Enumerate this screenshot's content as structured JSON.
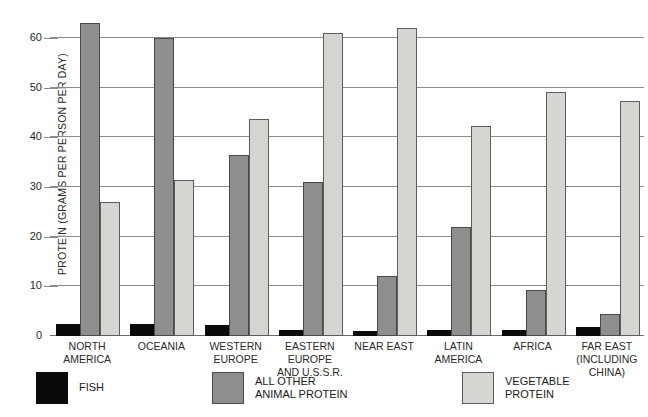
{
  "chart_data": {
    "type": "bar",
    "title": "",
    "xlabel": "",
    "ylabel": "PROTEIN (GRAMS PER PERSON PER DAY)",
    "ylim": [
      0,
      66
    ],
    "yticks": [
      0,
      10,
      20,
      30,
      40,
      50,
      60
    ],
    "ytick_labels": [
      "0",
      "10",
      "20",
      "30",
      "40",
      "50",
      "60"
    ],
    "grid": true,
    "legend_position": "bottom",
    "categories": [
      "NORTH AMERICA",
      "OCEANIA",
      "WESTERN EUROPE",
      "EASTERN EUROPE AND U.S.S.R.",
      "NEAR EAST",
      "LATIN AMERICA",
      "AFRICA",
      "FAR EAST (INCLUDING CHINA)"
    ],
    "category_lines": [
      [
        "NORTH",
        "AMERICA"
      ],
      [
        "OCEANIA"
      ],
      [
        "WESTERN",
        "EUROPE"
      ],
      [
        "EASTERN",
        "EUROPE",
        "AND U.S.S.R."
      ],
      [
        "NEAR EAST"
      ],
      [
        "LATIN",
        "AMERICA"
      ],
      [
        "AFRICA"
      ],
      [
        "FAR EAST",
        "(INCLUDING",
        "CHINA)"
      ]
    ],
    "series": [
      {
        "name": "FISH",
        "color": "#0a0a0a",
        "values": [
          2.5,
          2.4,
          2.3,
          1.3,
          1.0,
          1.3,
          1.2,
          1.8
        ]
      },
      {
        "name": "ALL OTHER ANIMAL PROTEIN",
        "color": "#8e8e8e",
        "values": [
          63.0,
          60.0,
          36.5,
          31.0,
          12.0,
          22.0,
          9.3,
          4.5
        ]
      },
      {
        "name": "VEGETABLE PROTEIN",
        "color": "#d5d5d2",
        "values": [
          27.0,
          31.3,
          43.6,
          61.0,
          62.0,
          42.2,
          49.2,
          47.2
        ]
      }
    ]
  },
  "legend": {
    "items": [
      {
        "label_lines": [
          "FISH"
        ],
        "swatch": "fish-swatch"
      },
      {
        "label_lines": [
          "ALL OTHER",
          "ANIMAL PROTEIN"
        ],
        "swatch": "animal-protein-swatch"
      },
      {
        "label_lines": [
          "VEGETABLE",
          "PROTEIN"
        ],
        "swatch": "vegetable-protein-swatch"
      }
    ]
  }
}
